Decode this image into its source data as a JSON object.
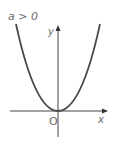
{
  "diagram": {
    "title_label": "a > 0",
    "y_axis_label": "y",
    "x_axis_label": "x",
    "origin_label": "O",
    "curve": "parabola opening upward with vertex at origin",
    "colors": {
      "curve": "#4a4a4a",
      "axes": "#444444",
      "labels": "#6a6a6a",
      "background": "#ffffff"
    }
  }
}
